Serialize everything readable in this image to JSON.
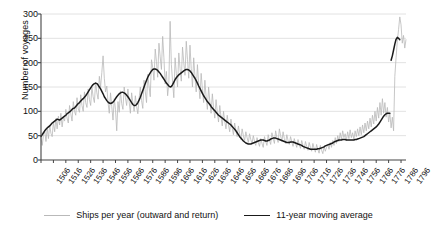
{
  "chart_data": {
    "type": "line",
    "title": "",
    "xlabel": "",
    "ylabel": "Number of voyages",
    "ylim": [
      0,
      300
    ],
    "yticks": [
      0,
      50,
      100,
      150,
      200,
      250,
      300
    ],
    "xlim": [
      1506,
      1800
    ],
    "xticks": [
      1506,
      1516,
      1526,
      1536,
      1546,
      1556,
      1566,
      1576,
      1586,
      1596,
      1606,
      1616,
      1626,
      1636,
      1646,
      1656,
      1666,
      1676,
      1686,
      1696,
      1706,
      1716,
      1726,
      1736,
      1746,
      1756,
      1766,
      1776,
      1786,
      1796
    ],
    "grid": "horizontal",
    "legend_position": "bottom-center",
    "colors": {
      "annual": "#b9b9b9",
      "moving_average": "#1a1a1a",
      "grid": "#e2e2e2",
      "axis": "#444444"
    },
    "series": [
      {
        "name": "Ships per year (outward and return)",
        "style": "thin-gray",
        "x_start": 1506,
        "values": [
          45,
          30,
          52,
          60,
          38,
          66,
          44,
          72,
          55,
          48,
          78,
          58,
          85,
          64,
          90,
          72,
          96,
          68,
          88,
          80,
          104,
          86,
          76,
          112,
          95,
          80,
          120,
          100,
          92,
          128,
          105,
          98,
          134,
          112,
          100,
          140,
          118,
          108,
          146,
          124,
          112,
          150,
          130,
          118,
          160,
          138,
          125,
          172,
          150,
          180,
          214,
          168,
          140,
          152,
          118,
          96,
          138,
          110,
          82,
          126,
          104,
          60,
          120,
          98,
          142,
          116,
          104,
          150,
          128,
          112,
          146,
          120,
          96,
          138,
          118,
          100,
          132,
          110,
          95,
          126,
          150,
          122,
          106,
          164,
          140,
          118,
          176,
          152,
          130,
          206,
          190,
          164,
          228,
          202,
          170,
          240,
          212,
          186,
          254,
          210,
          156,
          182,
          132,
          158,
          285,
          196,
          160,
          128,
          210,
          178,
          150,
          220,
          188,
          162,
          232,
          200,
          174,
          244,
          206,
          168,
          236,
          188,
          150,
          210,
          172,
          140,
          196,
          158,
          126,
          178,
          146,
          118,
          164,
          130,
          104,
          150,
          120,
          96,
          136,
          108,
          86,
          124,
          98,
          78,
          112,
          88,
          70,
          100,
          80,
          64,
          92,
          72,
          58,
          84,
          66,
          52,
          76,
          60,
          48,
          70,
          54,
          42,
          64,
          50,
          40,
          58,
          46,
          36,
          54,
          42,
          34,
          50,
          38,
          30,
          46,
          36,
          28,
          44,
          34,
          26,
          48,
          38,
          30,
          52,
          40,
          32,
          56,
          44,
          34,
          60,
          46,
          36,
          64,
          50,
          38,
          58,
          44,
          34,
          52,
          40,
          32,
          48,
          38,
          28,
          44,
          34,
          26,
          42,
          32,
          24,
          40,
          30,
          22,
          38,
          28,
          20,
          36,
          26,
          18,
          34,
          24,
          16,
          32,
          22,
          14,
          30,
          20,
          13,
          28,
          18,
          26,
          32,
          22,
          36,
          26,
          40,
          30,
          46,
          34,
          50,
          38,
          56,
          42,
          60,
          46,
          54,
          40,
          58,
          44,
          62,
          46,
          56,
          42,
          60,
          48,
          64,
          50,
          68,
          52,
          72,
          56,
          76,
          60,
          80,
          64,
          86,
          68,
          92,
          74,
          100,
          80,
          108,
          86,
          118,
          92,
          126,
          96,
          118,
          88,
          108,
          78,
          96,
          66,
          88,
          60,
          172,
          210,
          244,
          268,
          294,
          278,
          240,
          256,
          230,
          248,
          262,
          236,
          268,
          252,
          244
        ],
        "note": "Annual counts; noisy vertical trace. Peaks near 1546 (214), 1600 (285), 1790s (294)."
      },
      {
        "name": "11-year moving average",
        "style": "thick-black",
        "x_start": 1506,
        "values": [
          48,
          52,
          56,
          60,
          63,
          66,
          68,
          70,
          73,
          76,
          78,
          80,
          82,
          84,
          83,
          82,
          84,
          86,
          88,
          90,
          92,
          95,
          97,
          99,
          101,
          104,
          106,
          107,
          110,
          113,
          116,
          118,
          121,
          124,
          126,
          129,
          132,
          136,
          140,
          144,
          148,
          152,
          155,
          157,
          158,
          157,
          154,
          150,
          146,
          141,
          136,
          130,
          126,
          122,
          119,
          117,
          116,
          117,
          119,
          122,
          126,
          130,
          133,
          136,
          138,
          139,
          139,
          138,
          136,
          133,
          130,
          126,
          122,
          118,
          114,
          112,
          112,
          114,
          118,
          123,
          129,
          136,
          143,
          150,
          157,
          164,
          170,
          175,
          179,
          183,
          186,
          187,
          187,
          186,
          184,
          181,
          178,
          174,
          170,
          166,
          162,
          158,
          155,
          152,
          150,
          151,
          155,
          160,
          165,
          169,
          172,
          175,
          177,
          179,
          181,
          183,
          185,
          186,
          186,
          185,
          183,
          180,
          176,
          172,
          168,
          163,
          158,
          152,
          147,
          142,
          137,
          132,
          128,
          124,
          120,
          117,
          114,
          110,
          107,
          104,
          101,
          98,
          95,
          92,
          90,
          88,
          86,
          84,
          82,
          80,
          78,
          76,
          74,
          72,
          69,
          66,
          63,
          60,
          56,
          52,
          48,
          45,
          42,
          39,
          37,
          35,
          34,
          33,
          33,
          33,
          34,
          35,
          36,
          37,
          38,
          39,
          40,
          41,
          41,
          41,
          40,
          39,
          39,
          40,
          41,
          43,
          44,
          45,
          45,
          45,
          44,
          43,
          42,
          41,
          40,
          39,
          38,
          37,
          36,
          36,
          36,
          37,
          37,
          37,
          36,
          35,
          34,
          33,
          32,
          31,
          30,
          28,
          27,
          26,
          25,
          24,
          23,
          22,
          22,
          22,
          22,
          22,
          22,
          23,
          23,
          24,
          25,
          26,
          27,
          29,
          30,
          31,
          32,
          33,
          34,
          35,
          37,
          38,
          39,
          40,
          41,
          41,
          41,
          42,
          42,
          42,
          41,
          41,
          41,
          41,
          41,
          41,
          41,
          42,
          42,
          43,
          44,
          45,
          46,
          47,
          48,
          50,
          52,
          54,
          56,
          58,
          60,
          62,
          64,
          66,
          68,
          71,
          74,
          78,
          82,
          86,
          90,
          93,
          95,
          96,
          96,
          96,
          205,
          214,
          226,
          238,
          248,
          252,
          250,
          247
        ],
        "note": "Smoothed trend. Gap/jump near 1786 where data restarts at ~205."
      }
    ]
  },
  "axes": {
    "ytick_labels": [
      "300",
      "250",
      "200",
      "150",
      "100",
      "50",
      "0"
    ],
    "xtick_labels": [
      "1506",
      "1516",
      "1526",
      "1536",
      "1546",
      "1556",
      "1566",
      "1576",
      "1586",
      "1596",
      "1606",
      "1616",
      "1626",
      "1636",
      "1646",
      "1656",
      "1666",
      "1676",
      "1686",
      "1696",
      "1706",
      "1716",
      "1726",
      "1736",
      "1746",
      "1756",
      "1766",
      "1776",
      "1786",
      "1796"
    ],
    "ylabel": "Number of voyages"
  },
  "legend": {
    "items": [
      {
        "label": "Ships per year (outward and return)",
        "color": "#b9b9b9",
        "weight": "thin"
      },
      {
        "label": "11-year moving average",
        "color": "#1a1a1a",
        "weight": "thick"
      }
    ]
  }
}
